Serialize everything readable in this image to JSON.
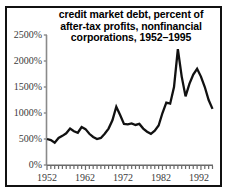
{
  "chart_data": {
    "type": "line",
    "title": "credit market debt, percent of after-tax profits, nonfinancial corporations, 1952–1995",
    "title_lines": [
      "credit market debt, percent of",
      "after-tax profits, nonfinancial",
      "corporations, 1952–1995"
    ],
    "xlabel": "",
    "ylabel": "",
    "ylim": [
      0,
      2500
    ],
    "xlim": [
      1952,
      1995
    ],
    "ytick_labels": [
      "2500%",
      "2000%",
      "1500%",
      "1000%",
      "500%",
      "0%"
    ],
    "ytick_values": [
      2500,
      2000,
      1500,
      1000,
      500,
      0
    ],
    "xtick_labels": [
      "1952",
      "1962",
      "1972",
      "1982",
      "1992"
    ],
    "xtick_values": [
      1952,
      1962,
      1972,
      1982,
      1992
    ],
    "grid": false,
    "legend": null,
    "line_color": "#111111",
    "axis_color": "#8a8a8a",
    "series": [
      {
        "name": "credit market debt as percent of after-tax profits",
        "x": [
          1952,
          1953,
          1954,
          1955,
          1956,
          1957,
          1958,
          1959,
          1960,
          1961,
          1962,
          1963,
          1964,
          1965,
          1966,
          1967,
          1968,
          1969,
          1970,
          1971,
          1972,
          1973,
          1974,
          1975,
          1976,
          1977,
          1978,
          1979,
          1980,
          1981,
          1982,
          1983,
          1984,
          1985,
          1986,
          1987,
          1988,
          1989,
          1990,
          1991,
          1992,
          1993,
          1994,
          1995
        ],
        "values": [
          500,
          480,
          430,
          520,
          560,
          610,
          700,
          650,
          620,
          730,
          690,
          600,
          540,
          500,
          520,
          600,
          700,
          860,
          1120,
          960,
          790,
          780,
          800,
          770,
          790,
          700,
          640,
          600,
          660,
          760,
          1000,
          1200,
          1180,
          1500,
          2230,
          1700,
          1320,
          1560,
          1740,
          1850,
          1700,
          1500,
          1250,
          1080
        ]
      }
    ]
  }
}
